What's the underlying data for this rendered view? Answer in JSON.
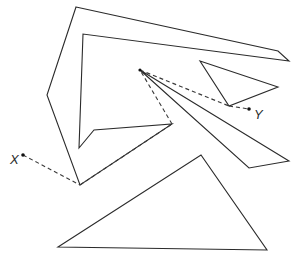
{
  "diagram": {
    "type": "visibility-graph-polygonal-obstacles",
    "points": {
      "start": {
        "label": "X",
        "x": 23,
        "y": 155
      },
      "goal": {
        "label": "Y",
        "x": 249,
        "y": 109
      }
    },
    "obstacles": [
      {
        "name": "concave-large-polygon",
        "vertices": [
          [
            76,
            7
          ],
          [
            278,
            51
          ],
          [
            289,
            61
          ],
          [
            83,
            34
          ],
          [
            79,
            148
          ],
          [
            94,
            130
          ],
          [
            172,
            124
          ],
          [
            80,
            185
          ],
          [
            47,
            95
          ]
        ]
      },
      {
        "name": "small-triangle",
        "vertices": [
          [
            200,
            61
          ],
          [
            278,
            87
          ],
          [
            229,
            106
          ]
        ]
      },
      {
        "name": "long-sliver-quad",
        "vertices": [
          [
            140,
            70
          ],
          [
            289,
            161
          ],
          [
            249,
            168
          ]
        ]
      },
      {
        "name": "bottom-triangle",
        "vertices": [
          [
            58,
            247
          ],
          [
            201,
            155
          ],
          [
            267,
            250
          ]
        ]
      }
    ],
    "path_segments": [
      {
        "from": [
          23,
          155
        ],
        "to": [
          80,
          185
        ]
      },
      {
        "from": [
          80,
          185
        ],
        "to": [
          172,
          124
        ]
      },
      {
        "from": [
          172,
          124
        ],
        "to": [
          140,
          70
        ]
      },
      {
        "from": [
          140,
          70
        ],
        "to": [
          229,
          106
        ]
      },
      {
        "from": [
          229,
          106
        ],
        "to": [
          249,
          109
        ]
      }
    ],
    "colors": {
      "stroke": "#2b2b2b",
      "background": "#ffffff"
    }
  }
}
